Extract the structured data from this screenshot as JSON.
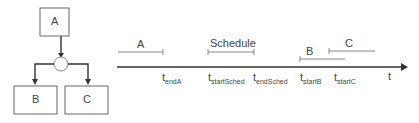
{
  "flow": {
    "node_a": "A",
    "node_b": "B",
    "node_c": "C"
  },
  "timeline": {
    "axis_label": "t",
    "intervals": [
      {
        "label": "A"
      },
      {
        "label": "Schedule"
      },
      {
        "label": "B"
      },
      {
        "label": "C"
      }
    ],
    "ticks": [
      {
        "t": "t",
        "sub": "endA"
      },
      {
        "t": "t",
        "sub": "startSched"
      },
      {
        "t": "t",
        "sub": "endSched"
      },
      {
        "t": "t",
        "sub": "startB"
      },
      {
        "t": "t",
        "sub": "startC"
      }
    ]
  }
}
